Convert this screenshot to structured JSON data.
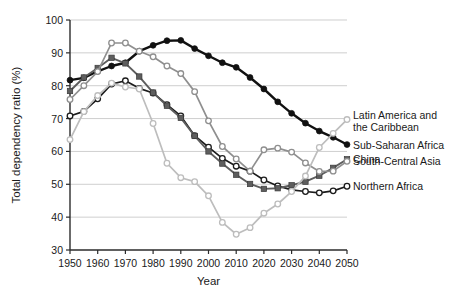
{
  "chart_data": {
    "type": "line",
    "title": "",
    "xlabel": "Year",
    "ylabel": "Total dependency ratio (%)",
    "xlim": [
      1950,
      2050
    ],
    "ylim": [
      30,
      100
    ],
    "xticks": [
      1950,
      1960,
      1970,
      1980,
      1990,
      2000,
      2010,
      2020,
      2030,
      2040,
      2050
    ],
    "yticks": [
      30,
      40,
      50,
      60,
      70,
      80,
      90,
      100
    ],
    "grid": "horizontal",
    "legend_position": "right-of-plot",
    "x": [
      1950,
      1955,
      1960,
      1965,
      1970,
      1975,
      1980,
      1985,
      1990,
      1995,
      2000,
      2005,
      2010,
      2015,
      2020,
      2025,
      2030,
      2035,
      2040,
      2045,
      2050
    ],
    "series": [
      {
        "name": "Sub-Saharan Africa",
        "marker": "filled-circle",
        "color": "#111111",
        "values": [
          81.7,
          82.4,
          84.4,
          86.0,
          87.0,
          90.5,
          92.3,
          93.7,
          93.8,
          91.3,
          89.1,
          87.0,
          85.6,
          82.5,
          79.0,
          75.1,
          71.6,
          68.6,
          66.2,
          64.3,
          62.1
        ]
      },
      {
        "name": "Northern Africa",
        "marker": "open-circle",
        "color": "#1c1c1c",
        "values": [
          70.8,
          72.2,
          76.0,
          80.5,
          81.5,
          79.2,
          77.8,
          74.2,
          70.8,
          64.8,
          61.3,
          57.9,
          55.5,
          54.0,
          51.3,
          49.5,
          48.3,
          47.8,
          47.4,
          48.0,
          49.4
        ]
      },
      {
        "name": "China",
        "marker": "filled-square",
        "color": "#5e5e5e",
        "values": [
          78.4,
          82.5,
          85.4,
          88.5,
          86.8,
          82.8,
          77.9,
          73.9,
          70.2,
          64.7,
          60.0,
          56.3,
          52.9,
          50.1,
          48.6,
          48.8,
          49.7,
          50.8,
          52.6,
          55.0,
          57.6
        ]
      },
      {
        "name": "South-Central Asia",
        "marker": "open-circle",
        "color": "#8f8f8f",
        "values": [
          75.8,
          80.0,
          84.3,
          93.0,
          93.0,
          90.5,
          88.8,
          86.0,
          83.7,
          78.2,
          69.3,
          61.5,
          57.7,
          54.0,
          60.5,
          61.0,
          59.8,
          56.5,
          53.9,
          54.0,
          57.0
        ]
      },
      {
        "name": "Latin America and the Caribbean",
        "marker": "open-circle",
        "color": "#bdbdbd",
        "values": [
          63.6,
          72.1,
          77.0,
          80.8,
          79.6,
          79.0,
          68.5,
          56.4,
          52.0,
          50.8,
          46.5,
          38.4,
          34.8,
          36.8,
          41.2,
          44.0,
          47.8,
          52.5,
          61.2,
          65.5,
          69.7
        ]
      }
    ],
    "legend": [
      {
        "label_line1": "Latin America and",
        "label_line2": "the Caribbean",
        "series": "Latin America and the Caribbean"
      },
      {
        "label_line1": "Sub-Saharan Africa",
        "label_line2": "",
        "series": "Sub-Saharan Africa"
      },
      {
        "label_line1": "China",
        "label_line2": "",
        "series": "China"
      },
      {
        "label_line1": "Northern Africa",
        "label_line2": "",
        "series": "Northern Africa"
      },
      {
        "label_line1": "South-Central Asia",
        "label_line2": "",
        "series": "South-Central Asia"
      }
    ]
  }
}
